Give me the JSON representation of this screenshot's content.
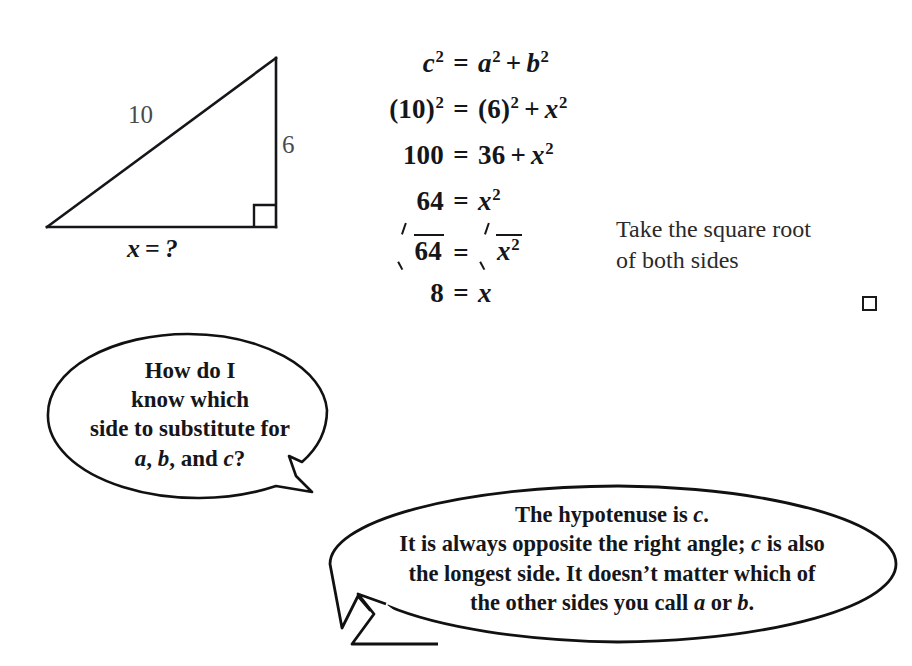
{
  "figure": {
    "name": "right-triangle-diagram",
    "labels": {
      "hypotenuse": "10",
      "vertical_leg": "6",
      "base_variable": "x",
      "base_operator": "=",
      "base_value": "?",
      "base_full": "x = ?"
    },
    "right_angle_marker": true
  },
  "equations": {
    "rows": [
      {
        "lhs_plain": "c²",
        "eq": "=",
        "rhs_plain": "a² + b²"
      },
      {
        "lhs_plain": "(10)²",
        "eq": "=",
        "rhs_plain": "(6)² + x²"
      },
      {
        "lhs_plain": "100",
        "eq": "=",
        "rhs_plain": "36 + x²"
      },
      {
        "lhs_plain": "64",
        "eq": "=",
        "rhs_plain": "x²"
      },
      {
        "lhs_plain": "√64",
        "eq": "=",
        "rhs_plain": "√x²"
      },
      {
        "lhs_plain": "8",
        "eq": "=",
        "rhs_plain": "x"
      }
    ],
    "row1": {
      "c": "c",
      "exp": "2",
      "eq": "=",
      "a": "a",
      "plus": "+",
      "b": "b"
    },
    "row2": {
      "ten": "(10)",
      "exp": "2",
      "eq": "=",
      "six": "(6)",
      "plus": "+",
      "x": "x"
    },
    "row3": {
      "hundred": "100",
      "eq": "=",
      "thirtysix": "36",
      "plus": "+",
      "x": "x",
      "exp": "2"
    },
    "row4": {
      "sixtyfour": "64",
      "eq": "=",
      "x": "x",
      "exp": "2"
    },
    "row5": {
      "sixtyfour": "64",
      "eq": "=",
      "x": "x",
      "exp": "2"
    },
    "row6": {
      "eight": "8",
      "eq": "=",
      "x": "x"
    }
  },
  "annotation": {
    "line1": "Take the square root",
    "line2": "of both sides"
  },
  "end_marker": {
    "symbol": "□",
    "meaning": "end-of-example-box"
  },
  "bubbles": {
    "question": {
      "line1": "How do I",
      "line2": "know which",
      "line3": "side to substitute for",
      "line4_a": "a",
      "line4_comma1": ", ",
      "line4_b": "b",
      "line4_and": ", and ",
      "line4_c": "c",
      "line4_q": "?",
      "full_text": "How do I know which side to substitute for a, b, and c?",
      "tail_direction": "down-right"
    },
    "answer": {
      "line1_pre": "The hypotenuse is ",
      "line1_var": "c",
      "line1_post": ".",
      "line2_pre": "It is always opposite the right angle; ",
      "line2_var": "c",
      "line2_post": " is also",
      "line3": "the longest side. It doesn’t matter which of",
      "line4_pre": "the other sides you call ",
      "line4_var_a": "a",
      "line4_or": " or ",
      "line4_var_b": "b",
      "line4_post": ".",
      "full_text": "The hypotenuse is c. It is always opposite the right angle; c is also the longest side. It doesn’t matter which of the other sides you call a or b.",
      "tail_direction": "down-left"
    }
  },
  "colors": {
    "background": "#ffffff",
    "ink": "#15161a",
    "light_ink": "#4a4a4a",
    "annotation_ink": "#2a2a2a"
  }
}
